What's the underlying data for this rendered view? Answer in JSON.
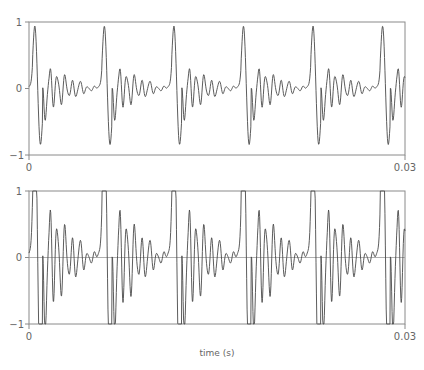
{
  "chart_data": [
    {
      "type": "line",
      "panel": "top",
      "title": "",
      "xlabel": "",
      "ylabel": "",
      "xlim": [
        0,
        0.03
      ],
      "ylim": [
        -1,
        1
      ],
      "x_tick_labels": [
        "0",
        "0.03"
      ],
      "y_tick_labels": [
        "1",
        "0",
        "−1"
      ],
      "grid": false,
      "legend": null,
      "description": "Periodic speech-like waveform, ~180 Hz fundamental (period ~0.0055 s), sharp bipolar pulse (~+0.92/-0.88) each period followed by decaying ringing oscillations between about -0.4 and +0.4",
      "series": [
        {
          "name": "original signal",
          "period_s": 0.00555,
          "first_peak_s": 0.00048,
          "peak_times_s": [
            0.0005,
            0.0059,
            0.0115,
            0.017,
            0.0226,
            0.0282
          ],
          "peak_value": 0.93,
          "trough_value": -0.88,
          "ringing_range": [
            -0.42,
            0.42
          ]
        }
      ]
    },
    {
      "type": "line",
      "panel": "bottom",
      "title": "",
      "xlabel": "time (s)",
      "ylabel": "",
      "xlim": [
        0,
        0.03
      ],
      "ylim": [
        -1,
        1
      ],
      "x_tick_labels": [
        "0",
        "0.03"
      ],
      "y_tick_labels": [
        "1",
        "0",
        "−1"
      ],
      "grid": false,
      "zero_line": true,
      "legend": null,
      "description": "Same waveform amplified (~2.5x) and hard-clipped at +/-1; pulses saturate to flat tops at 1 and -1, ringing now reaches about +/-0.9",
      "series": [
        {
          "name": "clipped signal",
          "gain": 2.4,
          "clip": [
            -1,
            1
          ]
        }
      ]
    }
  ],
  "top": {
    "y_top": "1",
    "y_mid": "0",
    "y_bot": "−1",
    "x_left": "0",
    "x_right": "0.03"
  },
  "bottom": {
    "y_top": "1",
    "y_mid": "0",
    "y_bot": "−1",
    "x_left": "0",
    "x_right": "0.03",
    "xlabel": "time (s)"
  },
  "colors": {
    "line": "#4a4a4a",
    "axis": "#8a8a8a",
    "label": "#666666"
  }
}
